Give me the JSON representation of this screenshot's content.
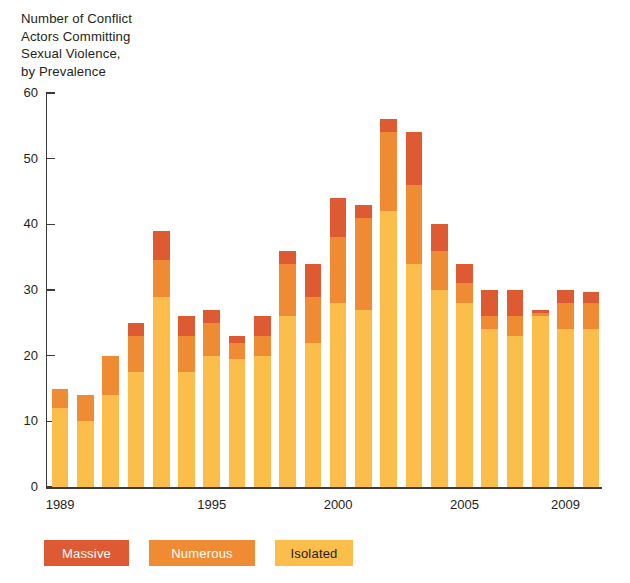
{
  "chart_data": {
    "type": "bar",
    "subtype": "stacked-vertical",
    "title": "Number of Conflict\nActors Committing\nSexual Violence,\nby Prevalence",
    "xlabel": "",
    "ylabel": "",
    "ylim": [
      0,
      60
    ],
    "yticks": [
      0,
      10,
      20,
      30,
      40,
      50,
      60
    ],
    "ytick_labels": [
      "0",
      "10",
      "20",
      "30",
      "40",
      "50",
      "60"
    ],
    "grid": false,
    "legend_position": "bottom-left",
    "categories": [
      "1989",
      "1990",
      "1991",
      "1992",
      "1993",
      "1994",
      "1995",
      "1996",
      "1997",
      "1998",
      "1999",
      "2000",
      "2001",
      "2002",
      "2003",
      "2004",
      "2005",
      "2006",
      "2007",
      "2008",
      "2009",
      "2010"
    ],
    "xtick_labels": [
      "1989",
      "1995",
      "2000",
      "2005",
      "2009"
    ],
    "xtick_categories": [
      "1989",
      "1995",
      "2000",
      "2005",
      "2009"
    ],
    "series": [
      {
        "name": "Isolated",
        "color": "#fbbe4a",
        "values": [
          12,
          10,
          14,
          17.5,
          29,
          17.5,
          20,
          19.5,
          20,
          26,
          22,
          28,
          27,
          42,
          34,
          30,
          28,
          24,
          23,
          26,
          24,
          24
        ]
      },
      {
        "name": "Numerous",
        "color": "#ee8b33",
        "values": [
          3,
          4,
          6,
          5.5,
          5.5,
          5.5,
          5,
          2.5,
          3,
          8,
          7,
          10,
          14,
          12,
          12,
          6,
          3,
          2,
          3,
          0.5,
          4,
          4
        ]
      },
      {
        "name": "Massive",
        "color": "#dd5a33",
        "values": [
          0,
          0,
          0,
          2,
          4.5,
          3,
          2,
          1,
          3,
          2,
          5,
          6,
          2,
          2,
          8,
          4,
          3,
          4,
          4,
          0.5,
          2,
          1.7
        ]
      }
    ],
    "totals": [
      15,
      14,
      20,
      25,
      39,
      26,
      27,
      23,
      26,
      36,
      34,
      44,
      43,
      56,
      54,
      40,
      34,
      30,
      30,
      27,
      30,
      29.7
    ],
    "legend": [
      {
        "label": "Massive",
        "color": "#dd5a33",
        "text_color": "#ffffff"
      },
      {
        "label": "Numerous",
        "color": "#ee8b33",
        "text_color": "#ffffff"
      },
      {
        "label": "Isolated",
        "color": "#fbbe4a",
        "text_color": "#231f20"
      }
    ]
  }
}
